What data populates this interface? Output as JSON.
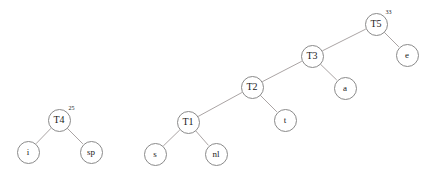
{
  "diagram": {
    "background_color": "#ffffff",
    "node_stroke_color": "#8a8a8a",
    "edge_color": "#a09a9a",
    "text_color": "#1a1a1a",
    "width": 437,
    "height": 174
  },
  "trees": [
    {
      "name": "left-tree",
      "root": "T4",
      "nodes": [
        {
          "id": "T4",
          "label": "T4",
          "superscript": "25",
          "cx": 59,
          "cy": 120,
          "r": 11.5,
          "font_size": 10
        },
        {
          "id": "i",
          "label": "i",
          "superscript": "",
          "cx": 28,
          "cy": 152,
          "r": 11.5,
          "font_size": 9
        },
        {
          "id": "sp",
          "label": "sp",
          "superscript": "",
          "cx": 91,
          "cy": 152,
          "r": 11.5,
          "font_size": 9
        }
      ],
      "edges": [
        {
          "from": "T4",
          "to": "i"
        },
        {
          "from": "T4",
          "to": "sp"
        }
      ]
    },
    {
      "name": "right-tree",
      "root": "T5",
      "nodes": [
        {
          "id": "T5",
          "label": "T5",
          "superscript": "33",
          "cx": 376,
          "cy": 24,
          "r": 11.5,
          "font_size": 10
        },
        {
          "id": "e",
          "label": "e",
          "superscript": "",
          "cx": 407,
          "cy": 55,
          "r": 11.5,
          "font_size": 9
        },
        {
          "id": "T3",
          "label": "T3",
          "superscript": "",
          "cx": 312,
          "cy": 56,
          "r": 11.5,
          "font_size": 10
        },
        {
          "id": "a",
          "label": "a",
          "superscript": "",
          "cx": 345,
          "cy": 88,
          "r": 11.5,
          "font_size": 9
        },
        {
          "id": "T2",
          "label": "T2",
          "superscript": "",
          "cx": 252,
          "cy": 87,
          "r": 11.5,
          "font_size": 10
        },
        {
          "id": "t",
          "label": "t",
          "superscript": "",
          "cx": 285,
          "cy": 120,
          "r": 11.5,
          "font_size": 9
        },
        {
          "id": "T1",
          "label": "T1",
          "superscript": "",
          "cx": 188,
          "cy": 122,
          "r": 11.5,
          "font_size": 10
        },
        {
          "id": "s",
          "label": "s",
          "superscript": "",
          "cx": 155,
          "cy": 154,
          "r": 11.5,
          "font_size": 9
        },
        {
          "id": "nl",
          "label": "nl",
          "superscript": "",
          "cx": 216,
          "cy": 154,
          "r": 11.5,
          "font_size": 9
        }
      ],
      "edges": [
        {
          "from": "T5",
          "to": "T3"
        },
        {
          "from": "T5",
          "to": "e"
        },
        {
          "from": "T3",
          "to": "T2"
        },
        {
          "from": "T3",
          "to": "a"
        },
        {
          "from": "T2",
          "to": "T1"
        },
        {
          "from": "T2",
          "to": "t"
        },
        {
          "from": "T1",
          "to": "s"
        },
        {
          "from": "T1",
          "to": "nl"
        }
      ]
    }
  ]
}
